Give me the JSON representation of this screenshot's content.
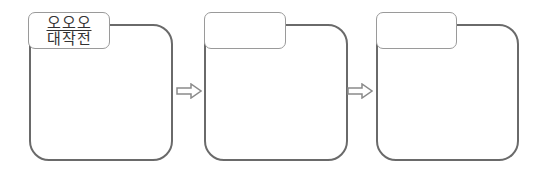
{
  "diagram": {
    "steps": [
      {
        "title_lines": [
          "오오오",
          "대작전"
        ]
      },
      {
        "title_lines": [
          "",
          ""
        ]
      },
      {
        "title_lines": [
          "",
          ""
        ]
      }
    ],
    "connector_icon": "hollow-right-arrow",
    "colors": {
      "panel_border": "#6a6a6a",
      "tab_border": "#9a9a9a",
      "arrow": "#8a8a8a"
    }
  }
}
